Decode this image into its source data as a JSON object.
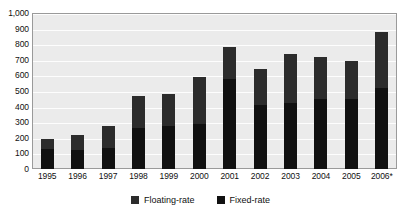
{
  "chart_data": {
    "type": "bar",
    "stacked": true,
    "title": "",
    "subtitle": "",
    "xlabel": "",
    "ylabel": "",
    "ylim": [
      0,
      1000
    ],
    "grid": true,
    "legend_position": "bottom",
    "categories": [
      "1995",
      "1996",
      "1997",
      "1998",
      "1999",
      "2000",
      "2001",
      "2002",
      "2003",
      "2004",
      "2005",
      "2006*"
    ],
    "ytick_labels": [
      "0",
      "100",
      "200",
      "300",
      "400",
      "500",
      "600",
      "700",
      "800",
      "900",
      "1,000"
    ],
    "ytick_values": [
      0,
      100,
      200,
      300,
      400,
      500,
      600,
      700,
      800,
      900,
      1000
    ],
    "series": [
      {
        "name": "Fixed-rate",
        "color": "#111111",
        "values": [
          130,
          125,
          135,
          265,
          275,
          290,
          575,
          410,
          425,
          450,
          450,
          520
        ]
      },
      {
        "name": "Floating-rate",
        "color": "#2c2c2c",
        "values": [
          60,
          90,
          140,
          205,
          205,
          300,
          205,
          230,
          315,
          265,
          245,
          360
        ]
      }
    ],
    "totals": [
      190,
      215,
      275,
      470,
      480,
      590,
      780,
      640,
      740,
      715,
      695,
      880
    ],
    "annotations": [
      "* 2006 value marked with asterisk"
    ]
  },
  "legend": {
    "entries": [
      {
        "label": "Floating-rate",
        "color": "#2c2c2c",
        "swatch": "square-swatch"
      },
      {
        "label": "Fixed-rate",
        "color": "#111111",
        "swatch": "square-swatch"
      }
    ]
  },
  "style": {
    "plot_background": "#ebebeb",
    "gridline_color": "#fdfdfd",
    "frame_color": "#9a9a9a",
    "page_background": "#ffffff",
    "text_color": "#111111"
  }
}
